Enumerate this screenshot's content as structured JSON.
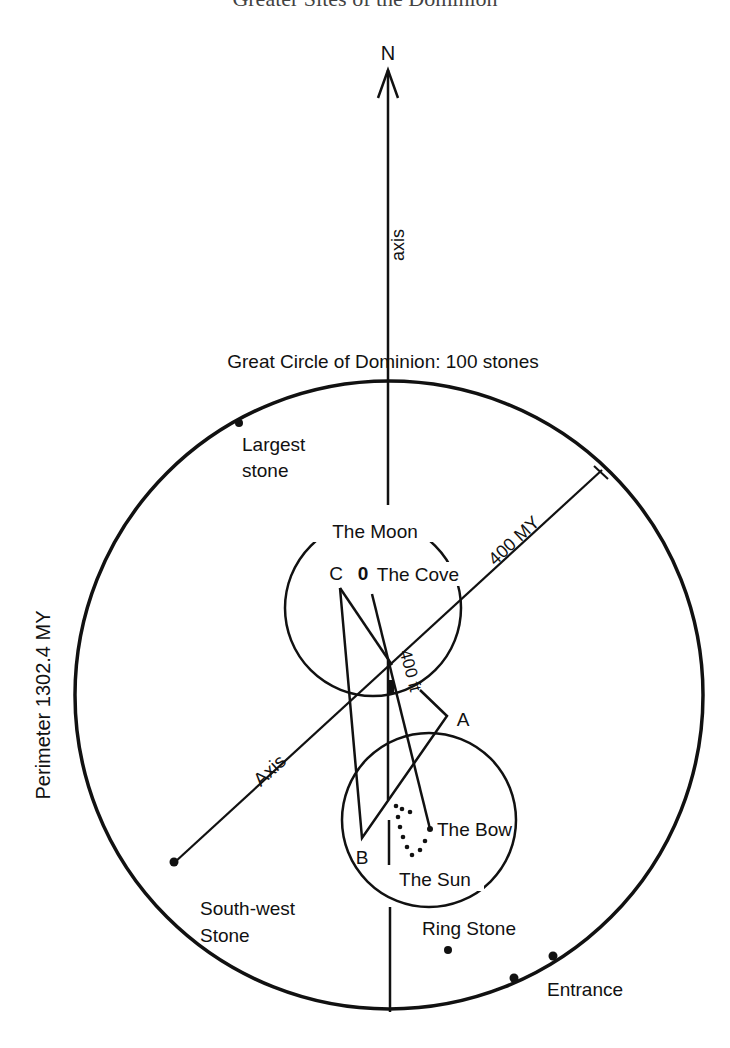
{
  "page": {
    "title": "Greater Sites of the Dominion"
  },
  "diagram": {
    "north_label": "N",
    "north_axis_label": "axis",
    "circle_title": "Great Circle of Dominion: 100 stones",
    "perimeter_label": "Perimeter 1302.4 MY",
    "radius_label": "400 MY",
    "diagonal_axis_label": "Axis",
    "inner_distance_label": "400 ft",
    "moon_label": "The Moon",
    "cove_label": "The Cove",
    "origin_label": "0",
    "sun_label": "The Sun",
    "bow_label": "The Bow",
    "point_a": "A",
    "point_b": "B",
    "point_c": "C",
    "stones": {
      "largest": [
        "Largest",
        "stone"
      ],
      "south_west": [
        "South-west",
        "Stone"
      ],
      "ring": "Ring Stone",
      "entrance": "Entrance"
    },
    "colors": {
      "ink": "#111111",
      "paper": "#ffffff"
    }
  }
}
